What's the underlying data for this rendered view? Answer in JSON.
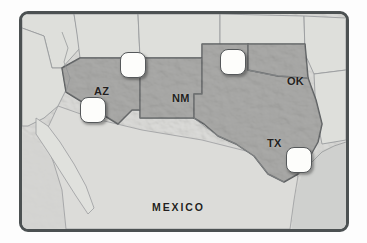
{
  "figure": {
    "kind": "relief-map",
    "region": "United States Southwest and Northern Mexico",
    "frame_border_color": "#4c5152",
    "background_color": "#ffffff"
  },
  "map": {
    "highlight_fill": "#aaaaa8",
    "base_fill": "#dcdcd9",
    "water_fill": "#cfd0ce",
    "border_line_color": "#5a5d5f",
    "state_line_color": "#8e9092",
    "highlighted_states": [
      {
        "code": "AZ",
        "label": "AZ",
        "x": 79,
        "y": 77
      },
      {
        "code": "NM",
        "label": "NM",
        "x": 158,
        "y": 84
      },
      {
        "code": "OK",
        "label": "OK",
        "x": 273,
        "y": 67
      },
      {
        "code": "TX",
        "label": "TX",
        "x": 252,
        "y": 129
      }
    ],
    "country_labels": [
      {
        "name": "MEXICO",
        "label": "MEXICO",
        "x": 163,
        "y": 193
      }
    ],
    "markers": [
      {
        "id": "marker-1",
        "x": 111,
        "y": 51,
        "shape": "rounded-square",
        "fill": "#fdfdfb"
      },
      {
        "id": "marker-2",
        "x": 71,
        "y": 96,
        "shape": "rounded-square",
        "fill": "#fdfdfb"
      },
      {
        "id": "marker-3",
        "x": 211,
        "y": 48,
        "shape": "rounded-square",
        "fill": "#fdfdfb"
      },
      {
        "id": "marker-4",
        "x": 277,
        "y": 146,
        "shape": "rounded-square",
        "fill": "#fdfdfb"
      }
    ]
  }
}
